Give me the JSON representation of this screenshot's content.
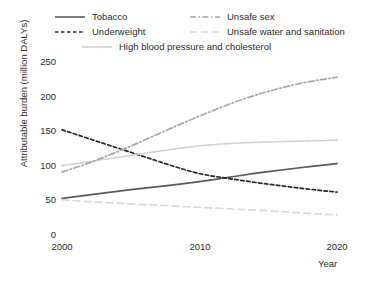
{
  "chart_data": {
    "type": "line",
    "title": "",
    "xlabel": "Year",
    "ylabel": "Attributable burden (million DALYs)",
    "xlim": [
      2000,
      2020
    ],
    "ylim": [
      0,
      250
    ],
    "xticks": [
      "2000",
      "2010",
      "2020"
    ],
    "yticks": [
      "0",
      "50",
      "100",
      "150",
      "200",
      "250"
    ],
    "grid": false,
    "legend_position": "top",
    "x": [
      2000,
      2002,
      2004,
      2006,
      2008,
      2010,
      2012,
      2014,
      2016,
      2018,
      2020
    ],
    "series": [
      {
        "name": "Tobacco",
        "style": "solid",
        "color": "#595959",
        "values": [
          53,
          58,
          63,
          68,
          72,
          77,
          83,
          89,
          94,
          99,
          103
        ]
      },
      {
        "name": "Underweight",
        "style": "dashed",
        "color": "#262626",
        "values": [
          152,
          139,
          126,
          113,
          100,
          88,
          82,
          76,
          71,
          66,
          62
        ]
      },
      {
        "name": "High blood pressure and cholesterol",
        "style": "dotted",
        "color": "#cfcfcf",
        "values": [
          100,
          106,
          112,
          118,
          124,
          129,
          132,
          134,
          135,
          136,
          137
        ]
      },
      {
        "name": "Unsafe sex",
        "style": "dashdot",
        "color": "#a6a6a6",
        "values": [
          91,
          104,
          120,
          137,
          155,
          172,
          188,
          202,
          213,
          222,
          228
        ]
      },
      {
        "name": "Unsafe water and sanitation",
        "style": "longdash",
        "color": "#d9d9d9",
        "values": [
          51,
          48,
          46,
          44,
          42,
          40,
          38,
          36,
          34,
          31,
          29
        ]
      }
    ]
  },
  "legend": {
    "entries": [
      {
        "label": "Tobacco"
      },
      {
        "label": "Underweight"
      },
      {
        "label": "High blood pressure and cholesterol"
      },
      {
        "label": "Unsafe sex"
      },
      {
        "label": "Unsafe water and sanitation"
      }
    ]
  }
}
